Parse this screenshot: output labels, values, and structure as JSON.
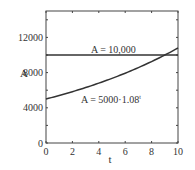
{
  "chart_data": {
    "type": "line",
    "title": "",
    "xlabel": "t",
    "ylabel": "A",
    "xlim": [
      0,
      10
    ],
    "ylim": [
      0,
      15000
    ],
    "xticks": [
      "0",
      "2",
      "4",
      "6",
      "8",
      "10"
    ],
    "yticks": [
      "0",
      "4000",
      "8000",
      "12000"
    ],
    "grid": false,
    "series": [
      {
        "name": "A = 10,000",
        "type": "constant",
        "x": [
          0,
          10
        ],
        "values": [
          10000,
          10000
        ]
      },
      {
        "name": "A = 5000·1.08^t",
        "type": "exponential",
        "x": [
          0,
          1,
          2,
          3,
          4,
          5,
          6,
          7,
          8,
          9,
          10
        ],
        "values": [
          5000,
          5400,
          5832,
          6299,
          6802,
          7347,
          7934,
          8569,
          9255,
          9995,
          10795
        ]
      }
    ],
    "annotations": [
      {
        "text": "A = 10,000",
        "near": "horizontal line"
      },
      {
        "text": "A = 5000·1.08",
        "superscript": "t",
        "near": "curve"
      }
    ]
  },
  "labels": {
    "xlabel": "t",
    "ylabel": "A",
    "line_label": "A = 10,000",
    "curve_label": "A = 5000·1.08",
    "curve_sup": "t"
  }
}
